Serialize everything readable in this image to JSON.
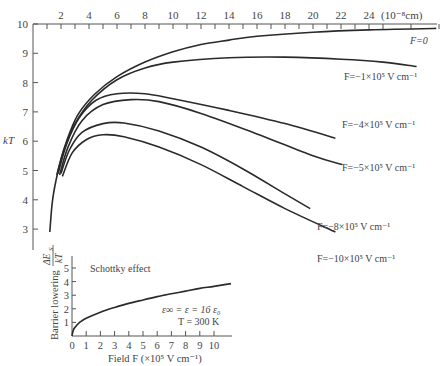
{
  "chart_data": [
    {
      "type": "line",
      "title": "",
      "xlabel": "(10^-8 cm)",
      "ylabel": "kT",
      "x_axis_position": "top",
      "xlim": [
        0,
        29
      ],
      "ylim": [
        2.2,
        10
      ],
      "x_ticks": [
        2,
        4,
        6,
        8,
        10,
        12,
        14,
        16,
        18,
        20,
        22,
        24
      ],
      "y_ticks": [
        3,
        4,
        5,
        6,
        7,
        8,
        9,
        10
      ],
      "x_unit_label": "(10⁻⁸cm)",
      "y_label": "kT",
      "grid": false,
      "series": [
        {
          "name": "F=0",
          "label": "F=0",
          "points": [
            [
              1.2,
              2.9
            ],
            [
              1.4,
              4.0
            ],
            [
              1.8,
              5.0
            ],
            [
              2.4,
              6.0
            ],
            [
              3.2,
              6.9
            ],
            [
              4.4,
              7.6
            ],
            [
              6,
              8.2
            ],
            [
              8,
              8.7
            ],
            [
              10,
              9.05
            ],
            [
              12,
              9.3
            ],
            [
              14,
              9.45
            ],
            [
              16,
              9.58
            ],
            [
              20,
              9.72
            ],
            [
              24,
              9.8
            ],
            [
              28.8,
              9.85
            ]
          ]
        },
        {
          "name": "F=-1x10^5 V/cm",
          "label": "F=−1×10⁵ V cm⁻¹",
          "points": [
            [
              1.7,
              4.85
            ],
            [
              2.2,
              5.7
            ],
            [
              3,
              6.6
            ],
            [
              4.2,
              7.4
            ],
            [
              6,
              8.1
            ],
            [
              8,
              8.5
            ],
            [
              10,
              8.7
            ],
            [
              14,
              8.85
            ],
            [
              18,
              8.87
            ],
            [
              22,
              8.8
            ],
            [
              25,
              8.7
            ],
            [
              27.4,
              8.55
            ]
          ]
        },
        {
          "name": "F=-4x10^5 V/cm",
          "label": "F=−4×10⁵ V cm⁻¹",
          "points": [
            [
              1.8,
              4.9
            ],
            [
              2.4,
              5.9
            ],
            [
              3.3,
              6.8
            ],
            [
              4.5,
              7.4
            ],
            [
              6,
              7.62
            ],
            [
              8,
              7.62
            ],
            [
              10,
              7.45
            ],
            [
              14,
              7.05
            ],
            [
              18,
              6.6
            ],
            [
              21.6,
              6.1
            ]
          ]
        },
        {
          "name": "F=-5x10^5 V/cm",
          "label": "F=−5×10⁵ V cm⁻¹",
          "points": [
            [
              1.9,
              4.85
            ],
            [
              2.5,
              5.8
            ],
            [
              3.5,
              6.7
            ],
            [
              5,
              7.25
            ],
            [
              7,
              7.42
            ],
            [
              9,
              7.35
            ],
            [
              12,
              6.95
            ],
            [
              16,
              6.25
            ],
            [
              20,
              5.5
            ],
            [
              22.1,
              5.2
            ]
          ]
        },
        {
          "name": "F=-8x10^5 V/cm",
          "label": "F=−8×10⁵ V cm⁻¹",
          "points": [
            [
              2.0,
              4.9
            ],
            [
              2.6,
              5.7
            ],
            [
              3.5,
              6.3
            ],
            [
              5,
              6.6
            ],
            [
              6.5,
              6.62
            ],
            [
              9,
              6.35
            ],
            [
              12,
              5.8
            ],
            [
              15,
              5.05
            ],
            [
              18,
              4.2
            ],
            [
              19.8,
              3.7
            ]
          ]
        },
        {
          "name": "F=-10x10^5 V/cm",
          "label": "F=−10×10⁵ V cm⁻¹",
          "points": [
            [
              2.1,
              4.8
            ],
            [
              2.8,
              5.6
            ],
            [
              3.8,
              6.05
            ],
            [
              5,
              6.22
            ],
            [
              6.5,
              6.15
            ],
            [
              9,
              5.8
            ],
            [
              12,
              5.2
            ],
            [
              15,
              4.45
            ],
            [
              18,
              3.7
            ],
            [
              21.6,
              2.9
            ]
          ]
        }
      ]
    },
    {
      "type": "line",
      "title": "Schottky effect",
      "xlabel": "Field F (×10⁵ V cm⁻¹)",
      "ylabel": "Barrier lowering ΔE_S/kT",
      "xlim": [
        0,
        11.5
      ],
      "ylim": [
        0,
        5.5
      ],
      "x_ticks": [
        0,
        1,
        2,
        3,
        4,
        5,
        6,
        7,
        8,
        9,
        10
      ],
      "y_ticks": [
        1,
        2,
        3,
        4,
        5
      ],
      "grid": false,
      "annotations": [
        "ε∞ = ε = 16 ε₀",
        "T = 300 K"
      ],
      "series": [
        {
          "name": "Schottky barrier lowering",
          "points": [
            [
              0,
              0
            ],
            [
              0.1,
              0.45
            ],
            [
              0.3,
              0.75
            ],
            [
              0.6,
              1.05
            ],
            [
              1,
              1.3
            ],
            [
              2,
              1.75
            ],
            [
              3,
              2.1
            ],
            [
              4,
              2.4
            ],
            [
              5,
              2.65
            ],
            [
              6,
              2.9
            ],
            [
              7,
              3.1
            ],
            [
              8,
              3.3
            ],
            [
              9,
              3.5
            ],
            [
              10,
              3.65
            ],
            [
              11.2,
              3.85
            ]
          ]
        }
      ]
    }
  ],
  "main": {
    "y_axis_label": "kT",
    "x_unit": "(10⁻⁸cm)",
    "x_tick_labels": [
      "2",
      "4",
      "6",
      "8",
      "10",
      "12",
      "14",
      "16",
      "18",
      "20",
      "22",
      "24"
    ],
    "y_tick_labels": [
      "3",
      "4",
      "5",
      "6",
      "7",
      "8",
      "9",
      "10"
    ],
    "curve_labels": [
      "F=0",
      "F=−1×10⁵ V cm⁻¹",
      "F=−4×10⁵ V cm⁻¹",
      "F=−5×10⁵ V cm⁻¹",
      "F=−8×10⁵ V cm⁻¹",
      "F=−10×10⁵ V cm⁻¹"
    ]
  },
  "inset": {
    "title": "Schottky effect",
    "y_axis_label_main": "Barrier lowering",
    "y_axis_label_frac_num": "ΔE",
    "y_axis_label_frac_sub": "S",
    "y_axis_label_frac_den": "kT",
    "x_axis_label": "Field F (×10⁵ V cm⁻¹)",
    "x_tick_labels": [
      "0",
      "1",
      "2",
      "3",
      "4",
      "5",
      "6",
      "7",
      "8",
      "9",
      "10"
    ],
    "y_tick_labels": [
      "1",
      "2",
      "3",
      "4",
      "5"
    ],
    "annotation_line1": "ε∞ = ε = 16 ε₀",
    "annotation_line2": "T = 300 K"
  }
}
